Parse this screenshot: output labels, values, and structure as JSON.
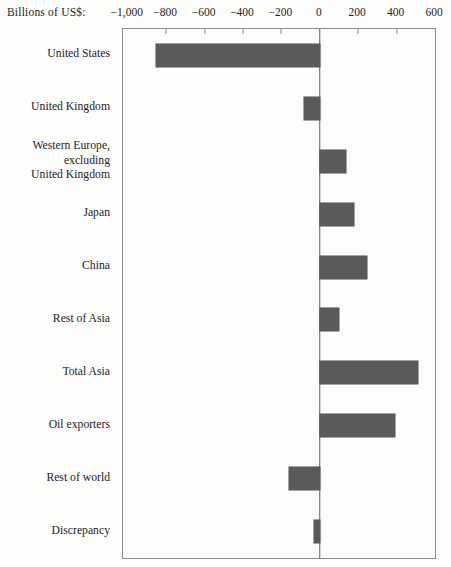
{
  "title": "Billions of US$:",
  "chart_data": {
    "type": "bar",
    "orientation": "horizontal",
    "title": "Billions of US$:",
    "xlabel": "Billions of US$",
    "ylabel": "",
    "categories": [
      "United States",
      "United Kingdom",
      "Western Europe,\nexcluding\nUnited Kingdom",
      "Japan",
      "China",
      "Rest of Asia",
      "Total Asia",
      "Oil exporters",
      "Rest of world",
      "Discrepancy"
    ],
    "values": [
      -855,
      -80,
      135,
      180,
      245,
      100,
      510,
      390,
      -160,
      -30
    ],
    "xlim": [
      -1025,
      600
    ],
    "xticks": [
      -1000,
      -800,
      -600,
      -400,
      -200,
      0,
      200,
      400,
      600
    ],
    "xtick_labels": [
      "−1,000",
      "−800",
      "−600",
      "−400",
      "−200",
      "0",
      "200",
      "400",
      "600"
    ],
    "grid": false,
    "legend": "none",
    "bar_color": "#5a5a5a",
    "frame_color": "#8a8a8a",
    "zero_line_color": "#5e5e5e",
    "background_color": "#fdfdfc",
    "text_color": "#1e1e1e"
  }
}
